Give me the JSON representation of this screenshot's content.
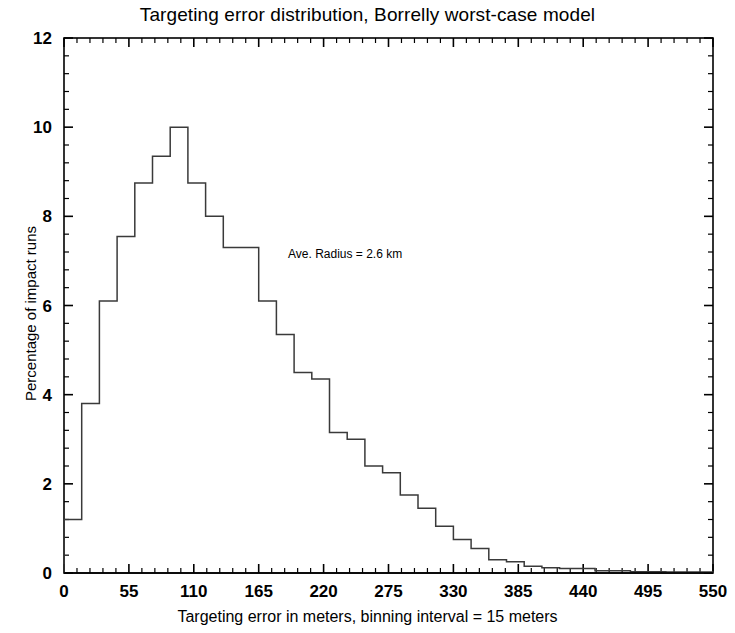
{
  "chart_data": {
    "type": "bar",
    "title": "Targeting error distribution, Borrelly worst-case model",
    "xlabel": "Targeting error in meters, binning interval = 15 meters",
    "ylabel": "Percentage of impact runs",
    "xlim": [
      0,
      550
    ],
    "ylim": [
      0,
      12
    ],
    "xticks": [
      0,
      55,
      110,
      165,
      220,
      275,
      330,
      385,
      440,
      495,
      550
    ],
    "yticks": [
      0,
      2,
      4,
      6,
      8,
      10,
      12
    ],
    "xtick_labels": [
      "0",
      "55",
      "110",
      "165",
      "220",
      "275",
      "330",
      "385",
      "440",
      "495",
      "550"
    ],
    "ytick_labels": [
      "0",
      "2",
      "4",
      "6",
      "8",
      "10",
      "12"
    ],
    "x_minor_tick_interval": 11,
    "y_minor_tick_interval": 0.4,
    "grid": false,
    "legend": false,
    "bin_width": 15,
    "bin_units": "meters",
    "annotations": [
      {
        "text": "Ave. Radius = 2.6 km",
        "x": 200,
        "y": 7.3
      }
    ],
    "bin_starts": [
      0,
      15,
      30,
      45,
      60,
      75,
      90,
      105,
      120,
      135,
      150,
      165,
      180,
      195,
      210,
      225,
      240,
      255,
      270,
      285,
      300,
      315,
      330,
      345,
      360,
      375,
      390,
      405,
      420,
      435,
      450,
      465,
      480,
      495,
      510,
      525,
      540
    ],
    "categories": [
      "0-15",
      "15-30",
      "30-45",
      "45-60",
      "60-75",
      "75-90",
      "90-105",
      "105-120",
      "120-135",
      "135-150",
      "150-165",
      "165-180",
      "180-195",
      "195-210",
      "210-225",
      "225-240",
      "240-255",
      "255-270",
      "270-285",
      "285-300",
      "300-315",
      "315-330",
      "330-345",
      "345-360",
      "360-375",
      "375-390",
      "390-405",
      "405-420",
      "420-435",
      "435-450",
      "450-465",
      "465-480",
      "480-495",
      "495-510",
      "510-525",
      "525-540",
      "540-550"
    ],
    "values": [
      1.2,
      3.8,
      6.1,
      7.55,
      8.75,
      9.35,
      10.0,
      8.75,
      8.0,
      7.3,
      7.3,
      6.1,
      5.35,
      4.5,
      4.35,
      3.15,
      3.0,
      2.4,
      2.25,
      1.75,
      1.45,
      1.05,
      0.75,
      0.55,
      0.3,
      0.25,
      0.15,
      0.12,
      0.1,
      0.1,
      0.05,
      0.05,
      0.03,
      0.03,
      0.02,
      0.02,
      0.02
    ],
    "series_name": "Percentage of impact runs",
    "line_color": "#3a3a3a",
    "background_color": "#ffffff",
    "axis_color": "#000000"
  },
  "axes_geometry": {
    "left_px": 64,
    "right_px": 713,
    "top_px": 38,
    "bottom_px": 573
  }
}
